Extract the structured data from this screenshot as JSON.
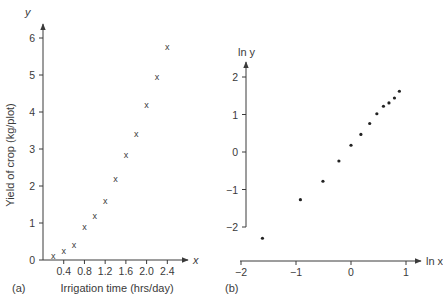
{
  "figure": {
    "panels": [
      "(a)",
      "(b)"
    ]
  },
  "chart_data": [
    {
      "type": "scatter",
      "panel_label": "(a)",
      "title": "",
      "xlabel": "Irrigation time (hrs/day)",
      "ylabel": "Yield of crop (kg/plot)",
      "x_axis_var": "x",
      "y_axis_var": "y",
      "marker": "x",
      "x_ticks": [
        0.4,
        0.8,
        1.2,
        1.6,
        2.0,
        2.4
      ],
      "x_tick_labels": [
        "0.4",
        "0.8",
        "1.2",
        "1.6",
        "2.0",
        "2.4"
      ],
      "y_ticks": [
        0,
        1,
        2,
        3,
        4,
        5,
        6
      ],
      "y_tick_labels": [
        "0",
        "1",
        "2",
        "3",
        "4",
        "5",
        "6"
      ],
      "xlim": [
        0,
        2.7
      ],
      "ylim": [
        0,
        6.3
      ],
      "grid": false,
      "x": [
        0.2,
        0.4,
        0.6,
        0.8,
        1.0,
        1.2,
        1.4,
        1.6,
        1.8,
        2.0,
        2.2,
        2.4
      ],
      "y": [
        0.1,
        0.25,
        0.4,
        0.9,
        1.2,
        1.6,
        2.2,
        2.85,
        3.4,
        4.2,
        4.95,
        5.75
      ]
    },
    {
      "type": "scatter",
      "panel_label": "(b)",
      "title": "",
      "xlabel": "",
      "ylabel": "",
      "x_axis_var": "ln x",
      "y_axis_var": "ln y",
      "marker": "dot",
      "x_ticks": [
        -2,
        -1,
        0,
        1
      ],
      "x_tick_labels": [
        "−2",
        "−1",
        "0",
        "1"
      ],
      "y_ticks": [
        -2,
        -1,
        0,
        1,
        2
      ],
      "y_tick_labels": [
        "−2",
        "−1",
        "0",
        "1",
        "2"
      ],
      "xlim": [
        -2,
        1.3
      ],
      "ylim": [
        -2,
        2.4
      ],
      "grid": false,
      "x": [
        -1.61,
        -0.92,
        -0.51,
        -0.22,
        0.0,
        0.18,
        0.34,
        0.47,
        0.59,
        0.69,
        0.79,
        0.88
      ],
      "y": [
        -2.3,
        -1.27,
        -0.78,
        -0.24,
        0.18,
        0.47,
        0.76,
        1.02,
        1.22,
        1.31,
        1.44,
        1.62
      ]
    }
  ]
}
